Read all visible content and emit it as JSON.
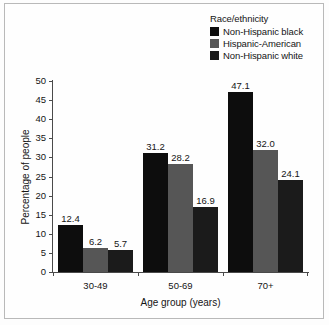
{
  "chart_data": {
    "type": "bar",
    "title": "",
    "xlabel": "Age group (years)",
    "ylabel": "Percentage of people",
    "categories": [
      "30-49",
      "50-69",
      "70+"
    ],
    "ylim": [
      0,
      50
    ],
    "yticks": [
      0,
      5,
      10,
      15,
      20,
      25,
      30,
      35,
      40,
      45,
      50
    ],
    "ytick_labels": [
      "0",
      "5",
      "10",
      "15",
      "20",
      "25",
      "30",
      "35",
      "40",
      "45",
      "50"
    ],
    "grid": false,
    "legend_position": "top-right",
    "legend_title": "Race/ethnicity",
    "series": [
      {
        "name": "Non-Hispanic black",
        "color": "#0d0d0d",
        "values": [
          12.4,
          31.2,
          47.1
        ],
        "labels": [
          "12.4",
          "31.2",
          "47.1"
        ]
      },
      {
        "name": "Hispanic-American",
        "color": "#565656",
        "values": [
          6.2,
          28.2,
          32.0
        ],
        "labels": [
          "6.2",
          "28.2",
          "32.0"
        ]
      },
      {
        "name": "Non-Hispanic white",
        "color": "#1b1b1b",
        "values": [
          5.7,
          16.9,
          24.1
        ],
        "labels": [
          "5.7",
          "16.9",
          "24.1"
        ]
      }
    ]
  },
  "figure": {
    "border_color": "#b9b9b9",
    "background": "#fefefe",
    "axis_color": "#4a4a4a",
    "text_color": "#151515"
  }
}
